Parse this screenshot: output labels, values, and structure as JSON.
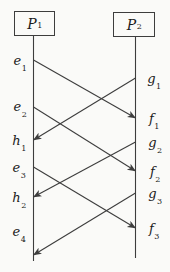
{
  "diagram": {
    "kind": "space-time-message-diagram",
    "colors": {
      "background": "#fafaf8",
      "line": "#3d3d3d",
      "text": "#1b1b1b"
    },
    "canvas": {
      "width": 170,
      "height": 272
    },
    "processes": [
      {
        "id": "P1",
        "label": {
          "base": "P",
          "sub": "1"
        },
        "box": {
          "x": 14,
          "y": 11,
          "w": 41,
          "h": 25
        },
        "line": {
          "x": 33.5,
          "y1": 36,
          "y2": 261
        }
      },
      {
        "id": "P2",
        "label": {
          "base": "P",
          "sub": "2"
        },
        "box": {
          "x": 113,
          "y": 12,
          "w": 42,
          "h": 25
        },
        "line": {
          "x": 135.5,
          "y1": 37,
          "y2": 258
        }
      }
    ],
    "events": [
      {
        "id": "e1",
        "base": "e",
        "sub": "1",
        "process": "P1",
        "label_x": 20,
        "label_y": 60
      },
      {
        "id": "e2",
        "base": "e",
        "sub": "2",
        "process": "P1",
        "label_x": 20,
        "label_y": 106
      },
      {
        "id": "h1",
        "base": "h",
        "sub": "1",
        "process": "P1",
        "label_x": 19,
        "label_y": 140
      },
      {
        "id": "e3",
        "base": "e",
        "sub": "3",
        "process": "P1",
        "label_x": 19,
        "label_y": 167
      },
      {
        "id": "h2",
        "base": "h",
        "sub": "2",
        "process": "P1",
        "label_x": 19,
        "label_y": 197
      },
      {
        "id": "e4",
        "base": "e",
        "sub": "4",
        "process": "P1",
        "label_x": 19,
        "label_y": 231
      },
      {
        "id": "g1",
        "base": "g",
        "sub": "1",
        "process": "P2",
        "label_x": 154,
        "label_y": 78
      },
      {
        "id": "f1",
        "base": "f",
        "sub": "1",
        "process": "P2",
        "label_x": 154,
        "label_y": 118
      },
      {
        "id": "g2",
        "base": "g",
        "sub": "2",
        "process": "P2",
        "label_x": 155,
        "label_y": 142
      },
      {
        "id": "f2",
        "base": "f",
        "sub": "2",
        "process": "P2",
        "label_x": 155,
        "label_y": 171
      },
      {
        "id": "g3",
        "base": "g",
        "sub": "3",
        "process": "P2",
        "label_x": 155,
        "label_y": 193
      },
      {
        "id": "f3",
        "base": "f",
        "sub": "3",
        "process": "P2",
        "label_x": 154,
        "label_y": 228
      }
    ],
    "messages": [
      {
        "from": "e1",
        "to": "f1",
        "x1": 33.5,
        "y1": 60,
        "x2": 135.5,
        "y2": 118
      },
      {
        "from": "g1",
        "to": "h1",
        "x1": 135.5,
        "y1": 78,
        "x2": 33.5,
        "y2": 140
      },
      {
        "from": "e2",
        "to": "f2",
        "x1": 33.5,
        "y1": 107,
        "x2": 135.5,
        "y2": 171
      },
      {
        "from": "g2",
        "to": "h2",
        "x1": 135.5,
        "y1": 142,
        "x2": 33.5,
        "y2": 197
      },
      {
        "from": "e3",
        "to": "f3",
        "x1": 33.5,
        "y1": 167,
        "x2": 135.5,
        "y2": 228
      },
      {
        "from": "g3",
        "to": "p1-line-end",
        "x1": 135.5,
        "y1": 193,
        "x2": 33.5,
        "y2": 255
      }
    ]
  }
}
